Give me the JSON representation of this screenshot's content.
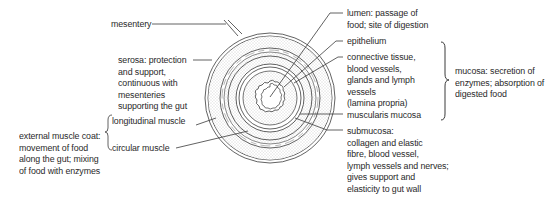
{
  "diagram": {
    "labels": {
      "mesentery": "mesentery",
      "serosa": "serosa: protection\nand support,\ncontinuous with\nmesenteries\nsupporting the gut",
      "longitudinal_muscle": "longitudinal muscle",
      "circular_muscle": "circular muscle",
      "external_muscle_coat": "external muscle coat:\nmovement of food\nalong the gut; mixing\nof food with enzymes",
      "lumen": "lumen: passage of\nfood; site of digestion",
      "epithelium": "epithelium",
      "lamina_propria": "connective tissue,\nblood vessels,\nglands and lymph\nvessels\n(lamina propria)",
      "muscularis_mucosa": "muscularis mucosa",
      "mucosa": "mucosa: secretion of\nenzymes; absorption of\ndigested food",
      "submucosa": "submucosa:\ncollagen and elastic\nfibre, blood vessel,\nlymph vessels and nerves;\ngives support and\nelasticity to gut wall"
    },
    "colors": {
      "line": "#3a3a3a",
      "stipple": "#9a9a9a",
      "text": "#2a2a2a"
    }
  }
}
